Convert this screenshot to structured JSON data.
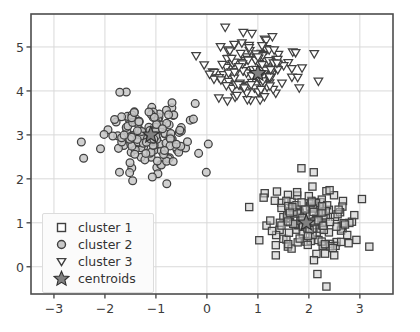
{
  "chart_data": {
    "type": "scatter",
    "title": "",
    "xlabel": "",
    "ylabel": "",
    "xlim": [
      -3.45,
      3.65
    ],
    "ylim": [
      -0.62,
      5.75
    ],
    "xticks": [
      "-3",
      "-2",
      "-1",
      "0",
      "1",
      "2",
      "3"
    ],
    "xtick_values": [
      -3,
      -2,
      -1,
      0,
      1,
      2,
      3
    ],
    "yticks": [
      "0",
      "1",
      "2",
      "3",
      "4",
      "5"
    ],
    "ytick_values": [
      0,
      1,
      2,
      3,
      4,
      5
    ],
    "grid": true,
    "legend_position": "lower left",
    "series": [
      {
        "name": "cluster 1",
        "marker": "square",
        "face_color": "#c8c8c8",
        "edge_color": "#404040",
        "n": 150,
        "center": [
          1.95,
          1.0
        ],
        "spread": [
          0.42,
          0.4
        ]
      },
      {
        "name": "cluster 2",
        "marker": "circle",
        "face_color": "#c8c8c8",
        "edge_color": "#404040",
        "n": 150,
        "center": [
          -1.1,
          3.0
        ],
        "spread": [
          0.45,
          0.38
        ]
      },
      {
        "name": "cluster 3",
        "marker": "triangle-down",
        "face_color": "#ffffff",
        "edge_color": "#404040",
        "n": 150,
        "center": [
          1.0,
          4.4
        ],
        "spread": [
          0.4,
          0.33
        ]
      }
    ],
    "centroids": {
      "name": "centroids",
      "marker": "star",
      "face_color": "#808080",
      "edge_color": "#303030",
      "points": [
        [
          1.95,
          1.0
        ],
        [
          -1.1,
          3.0
        ],
        [
          1.0,
          4.4
        ]
      ]
    },
    "axes_color": "#4d4d4d",
    "grid_color": "#d9d9d9",
    "background": "#ffffff"
  },
  "legend": {
    "items": [
      {
        "label": "cluster 1",
        "marker": "square"
      },
      {
        "label": "cluster 2",
        "marker": "circle"
      },
      {
        "label": "cluster 3",
        "marker": "triangle-down"
      },
      {
        "label": "centroids",
        "marker": "star"
      }
    ]
  }
}
